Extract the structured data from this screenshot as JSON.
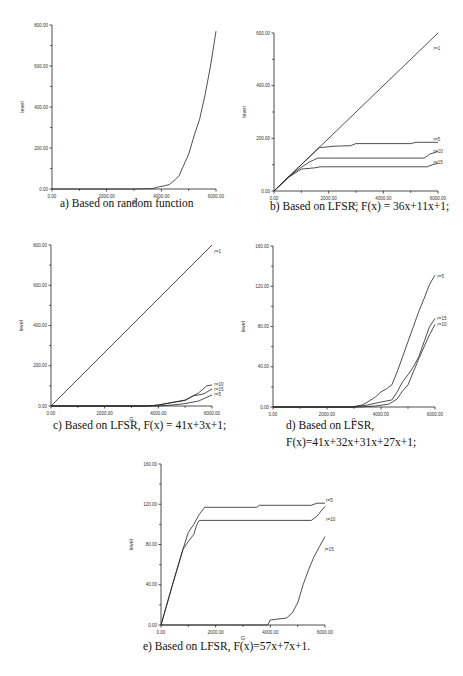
{
  "chart_data": [
    {
      "id": "a",
      "type": "line",
      "caption": [
        "a) Based on random function"
      ],
      "xlabel": "G",
      "ylabel": "level",
      "xlim": [
        0,
        6000
      ],
      "ylim": [
        0,
        800
      ],
      "xticks": [
        "0.00",
        "2000.00",
        "4000.00",
        "6000.00"
      ],
      "yticks": [
        "0.00",
        "200.00",
        "400.00",
        "600.00",
        "800.00"
      ],
      "box": {
        "x0": 52,
        "y0": 189,
        "x1": 216,
        "y1": 25
      },
      "series": [
        {
          "name": "",
          "label": "",
          "points": [
            [
              0,
              0
            ],
            [
              3000,
              0
            ],
            [
              3700,
              2
            ],
            [
              3900,
              10
            ],
            [
              4100,
              15
            ],
            [
              4300,
              22
            ],
            [
              4500,
              45
            ],
            [
              4650,
              65
            ],
            [
              4800,
              110
            ],
            [
              5000,
              170
            ],
            [
              5200,
              260
            ],
            [
              5400,
              340
            ],
            [
              5600,
              460
            ],
            [
              5800,
              600
            ],
            [
              6000,
              770
            ]
          ]
        }
      ]
    },
    {
      "id": "b",
      "type": "line",
      "caption": [
        "b) Based on LFSR, F(x) = 36x+11x+1;"
      ],
      "xlabel": "G",
      "ylabel": "level",
      "xlim": [
        0,
        6000
      ],
      "ylim": [
        0,
        600
      ],
      "xticks": [
        "0.00",
        "2000.00",
        "4000.00",
        "6000.00"
      ],
      "yticks": [
        "0.00",
        "200.00",
        "400.00",
        "600.00"
      ],
      "box": {
        "x0": 274,
        "y0": 191,
        "x1": 438,
        "y1": 33
      },
      "series": [
        {
          "name": "r=1",
          "label": "r=1",
          "label_at": [
            5800,
            540
          ],
          "points": [
            [
              0,
              0
            ],
            [
              6000,
              600
            ]
          ]
        },
        {
          "name": "r=5",
          "label": "r=5",
          "label_at": [
            5800,
            195
          ],
          "points": [
            [
              0,
              0
            ],
            [
              500,
              50
            ],
            [
              1000,
              100
            ],
            [
              1650,
              165
            ],
            [
              1700,
              165
            ],
            [
              2200,
              170
            ],
            [
              2800,
              172
            ],
            [
              3000,
              180
            ],
            [
              5000,
              180
            ],
            [
              5200,
              185
            ],
            [
              6000,
              185
            ]
          ]
        },
        {
          "name": "r=10",
          "label": "r=10",
          "label_at": [
            5800,
            150
          ],
          "points": [
            [
              0,
              0
            ],
            [
              500,
              50
            ],
            [
              800,
              75
            ],
            [
              1000,
              90
            ],
            [
              1300,
              110
            ],
            [
              1600,
              125
            ],
            [
              2000,
              125
            ],
            [
              5500,
              125
            ],
            [
              5700,
              140
            ],
            [
              6000,
              150
            ]
          ]
        },
        {
          "name": "r=15",
          "label": "r=15",
          "label_at": [
            5800,
            108
          ],
          "points": [
            [
              0,
              0
            ],
            [
              500,
              50
            ],
            [
              800,
              70
            ],
            [
              1000,
              83
            ],
            [
              1500,
              88
            ],
            [
              1700,
              92
            ],
            [
              5600,
              92
            ],
            [
              5800,
              100
            ],
            [
              6000,
              105
            ]
          ]
        }
      ]
    },
    {
      "id": "c",
      "type": "line",
      "caption": [
        "c) Based on LFSR, F(x) = 41x+3x+1;"
      ],
      "xlabel": "G",
      "ylabel": "level",
      "xlim": [
        0,
        6000
      ],
      "ylim": [
        0,
        800
      ],
      "xticks": [
        "0.00",
        "2000.00",
        "4000.00",
        "6000.00"
      ],
      "yticks": [
        "0.00",
        "200.00",
        "400.00",
        "600.00",
        "800.00"
      ],
      "box": {
        "x0": 51,
        "y0": 406,
        "x1": 212,
        "y1": 245
      },
      "series": [
        {
          "name": "r=1",
          "label": "r=1",
          "label_at": [
            6050,
            770
          ],
          "points": [
            [
              0,
              0
            ],
            [
              6000,
              800
            ]
          ]
        },
        {
          "name": "r=10",
          "label": "r=10",
          "label_at": [
            6050,
            105
          ],
          "points": [
            [
              0,
              0
            ],
            [
              3600,
              0
            ],
            [
              4000,
              5
            ],
            [
              4400,
              15
            ],
            [
              5000,
              30
            ],
            [
              5500,
              65
            ],
            [
              5800,
              100
            ],
            [
              6000,
              105
            ]
          ]
        },
        {
          "name": "r=15",
          "label": "r=15",
          "label_at": [
            6050,
            82
          ],
          "points": [
            [
              0,
              0
            ],
            [
              3600,
              0
            ],
            [
              4000,
              5
            ],
            [
              4300,
              12
            ],
            [
              5000,
              28
            ],
            [
              5300,
              50
            ],
            [
              5700,
              60
            ],
            [
              6000,
              85
            ]
          ]
        },
        {
          "name": "r=5",
          "label": "r=5",
          "label_at": [
            6050,
            58
          ],
          "points": [
            [
              0,
              0
            ],
            [
              4000,
              0
            ],
            [
              4500,
              5
            ],
            [
              5000,
              12
            ],
            [
              5500,
              25
            ],
            [
              6000,
              55
            ]
          ]
        }
      ]
    },
    {
      "id": "d",
      "type": "line",
      "caption": [
        "d) Based on LFSR,",
        "F(x)=41x+32x+31x+27x+1;"
      ],
      "xlabel": "G",
      "ylabel": "level",
      "xlim": [
        0,
        6000
      ],
      "ylim": [
        0,
        160
      ],
      "xticks": [
        "0.00",
        "2000.00",
        "4000.00",
        "6000.00"
      ],
      "yticks": [
        "0.00",
        "40.00",
        "80.00",
        "120.00",
        "160.00"
      ],
      "box": {
        "x0": 273,
        "y0": 407,
        "x1": 435,
        "y1": 246
      },
      "series": [
        {
          "name": "r=5",
          "label": "r=5",
          "label_at": [
            6050,
            130
          ],
          "points": [
            [
              0,
              0
            ],
            [
              2900,
              0
            ],
            [
              3300,
              2
            ],
            [
              3500,
              5
            ],
            [
              3800,
              10
            ],
            [
              4000,
              15
            ],
            [
              4200,
              18
            ],
            [
              4400,
              22
            ],
            [
              4600,
              35
            ],
            [
              4800,
              50
            ],
            [
              5000,
              65
            ],
            [
              5200,
              80
            ],
            [
              5400,
              95
            ],
            [
              5600,
              108
            ],
            [
              5800,
              122
            ],
            [
              6000,
              131
            ]
          ]
        },
        {
          "name": "r=15",
          "label": "r=15",
          "label_at": [
            6050,
            88
          ],
          "points": [
            [
              0,
              0
            ],
            [
              3000,
              0
            ],
            [
              3500,
              2
            ],
            [
              4000,
              5
            ],
            [
              4400,
              7
            ],
            [
              4600,
              15
            ],
            [
              4800,
              25
            ],
            [
              5000,
              32
            ],
            [
              5200,
              40
            ],
            [
              5400,
              50
            ],
            [
              5600,
              65
            ],
            [
              5800,
              80
            ],
            [
              6000,
              88
            ]
          ]
        },
        {
          "name": "r=10",
          "label": "r=10",
          "label_at": [
            6050,
            82
          ],
          "points": [
            [
              0,
              0
            ],
            [
              3200,
              0
            ],
            [
              3800,
              1
            ],
            [
              4300,
              3
            ],
            [
              4600,
              8
            ],
            [
              4800,
              16
            ],
            [
              5000,
              22
            ],
            [
              5200,
              35
            ],
            [
              5400,
              48
            ],
            [
              5600,
              60
            ],
            [
              5800,
              72
            ],
            [
              6000,
              82
            ]
          ]
        }
      ]
    },
    {
      "id": "e",
      "type": "line",
      "caption": [
        "e) Based on LFSR, F(x)=57x+7x+1."
      ],
      "xlabel": "G",
      "ylabel": "level",
      "xlim": [
        0,
        6000
      ],
      "ylim": [
        0,
        160
      ],
      "xticks": [
        "0.00",
        "2000.00",
        "4000.00",
        "6000.00"
      ],
      "yticks": [
        "0.00",
        "40.00",
        "80.00",
        "120.00",
        "160.00"
      ],
      "box": {
        "x0": 161,
        "y0": 625,
        "x1": 325,
        "y1": 464
      },
      "series": [
        {
          "name": "r=5",
          "label": "r=5",
          "label_at": [
            6000,
            124
          ],
          "points": [
            [
              0,
              0
            ],
            [
              400,
              38
            ],
            [
              800,
              75
            ],
            [
              1000,
              92
            ],
            [
              1200,
              100
            ],
            [
              1400,
              110
            ],
            [
              1600,
              117
            ],
            [
              2000,
              117
            ],
            [
              3500,
              117
            ],
            [
              3600,
              119
            ],
            [
              5500,
              119
            ],
            [
              5700,
              121
            ],
            [
              6000,
              121
            ]
          ]
        },
        {
          "name": "r=10",
          "label": "r=10",
          "label_at": [
            6000,
            105
          ],
          "points": [
            [
              0,
              0
            ],
            [
              400,
              38
            ],
            [
              800,
              75
            ],
            [
              1000,
              83
            ],
            [
              1200,
              90
            ],
            [
              1300,
              99
            ],
            [
              1400,
              104
            ],
            [
              2000,
              104
            ],
            [
              5500,
              104
            ],
            [
              5700,
              108
            ],
            [
              6000,
              118
            ]
          ]
        },
        {
          "name": "r=15",
          "label": "r=15",
          "label_at": [
            5950,
            75
          ],
          "points": [
            [
              0,
              0
            ],
            [
              3900,
              0
            ],
            [
              4000,
              5
            ],
            [
              4600,
              7
            ],
            [
              4800,
              12
            ],
            [
              5000,
              22
            ],
            [
              5200,
              40
            ],
            [
              5400,
              55
            ],
            [
              5600,
              68
            ],
            [
              5800,
              78
            ],
            [
              6000,
              88
            ]
          ]
        }
      ]
    }
  ],
  "captions": {
    "a": "a) Based on random function",
    "b": "b) Based on LFSR, F(x) = 36x+11x+1;",
    "c": "c) Based on LFSR, F(x) = 41x+3x+1;",
    "d1": "d) Based on LFSR,",
    "d2": "F(x)=41x+32x+31x+27x+1;",
    "e": "e) Based on LFSR, F(x)=57x+7x+1."
  }
}
